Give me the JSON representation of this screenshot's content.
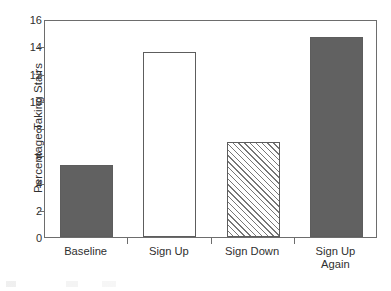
{
  "chart_data": {
    "type": "bar",
    "title": "",
    "subtitle": "",
    "xlabel": "",
    "ylabel": "Percentage Taking Stairs",
    "categories": [
      "Baseline",
      "Sign Up",
      "Sign Down",
      "Sign Up\nAgain"
    ],
    "values": [
      5.3,
      13.6,
      6.95,
      14.65
    ],
    "ylim": [
      0,
      16
    ],
    "yticks": [
      0,
      2,
      4,
      6,
      8,
      10,
      12,
      14,
      16
    ],
    "ytick_labels": [
      "0",
      "2",
      "4",
      "6",
      "8",
      "10",
      "12",
      "14",
      "16"
    ],
    "grid": false,
    "legend": false,
    "legend_position": "none",
    "bar_styles": [
      "solid",
      "open",
      "hatch",
      "solid"
    ],
    "colors": {
      "solid_fill": "#616161",
      "open_fill": "#ffffff",
      "hatch_line": "#777777",
      "bar_edge": "#5d5d5d",
      "axis_line": "#6d6d6d",
      "text": "#2f2f2f",
      "background": "#ffffff"
    }
  }
}
